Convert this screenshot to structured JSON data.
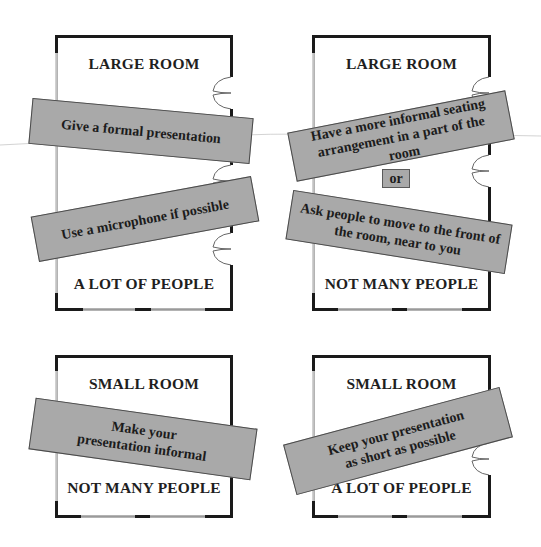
{
  "colors": {
    "banner_fill": "#a9a9a9",
    "banner_border": "#4a4a4a",
    "wall": "#1a1a1a",
    "window": "#9a9a9a"
  },
  "rooms": [
    {
      "size_label": "LARGE ROOM",
      "people_label": "A LOT OF PEOPLE",
      "banners": [
        "Give a formal presentation",
        "Use a microphone if possible"
      ]
    },
    {
      "size_label": "LARGE ROOM",
      "people_label": "NOT MANY PEOPLE",
      "banners": [
        "Have a more informal seating arrangement in a part of the room",
        "Ask people to move to the front of the room, near to you"
      ],
      "connector": "or"
    },
    {
      "size_label": "SMALL ROOM",
      "people_label": "NOT MANY PEOPLE",
      "banners": [
        "Make your presentation informal"
      ]
    },
    {
      "size_label": "SMALL ROOM",
      "people_label": "A LOT OF PEOPLE",
      "banners": [
        "Keep your presentation as short as possible"
      ]
    }
  ]
}
